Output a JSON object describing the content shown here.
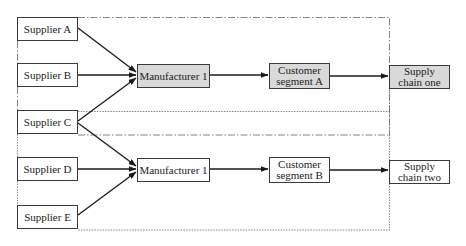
{
  "diagram": {
    "type": "supply-chain-flow",
    "colors": {
      "line": "#1a1a1a",
      "border": "#3a3a3a",
      "shaded_fill": "#d9d9d9",
      "plain_fill": "#ffffff",
      "frame": "#555555"
    },
    "suppliers": [
      {
        "id": "A",
        "label": "Supplier A"
      },
      {
        "id": "B",
        "label": "Supplier B"
      },
      {
        "id": "C",
        "label": "Supplier C"
      },
      {
        "id": "D",
        "label": "Supplier D"
      },
      {
        "id": "E",
        "label": "Supplier E"
      }
    ],
    "chain_one": {
      "manufacturer": "Manufacturer 1",
      "customer_segment": "Customer\nsegment A",
      "supply_chain": "Supply\nchain one",
      "frame_style": "dash-dot",
      "shaded": true
    },
    "chain_two": {
      "manufacturer": "Manufacturer 1",
      "customer_segment": "Customer\nsegment B",
      "supply_chain": "Supply\nchain two",
      "frame_style": "dotted",
      "shaded": false
    },
    "edges": [
      {
        "from": "Supplier A",
        "to": "Manufacturer 1 (chain one)"
      },
      {
        "from": "Supplier B",
        "to": "Manufacturer 1 (chain one)"
      },
      {
        "from": "Supplier C",
        "to": "Manufacturer 1 (chain one)"
      },
      {
        "from": "Supplier C",
        "to": "Manufacturer 1 (chain two)"
      },
      {
        "from": "Supplier D",
        "to": "Manufacturer 1 (chain two)"
      },
      {
        "from": "Supplier E",
        "to": "Manufacturer 1 (chain two)"
      },
      {
        "from": "Manufacturer 1 (chain one)",
        "to": "Customer segment A"
      },
      {
        "from": "Customer segment A",
        "to": "Supply chain one"
      },
      {
        "from": "Manufacturer 1 (chain two)",
        "to": "Customer segment B"
      },
      {
        "from": "Customer segment B",
        "to": "Supply chain two"
      }
    ]
  }
}
